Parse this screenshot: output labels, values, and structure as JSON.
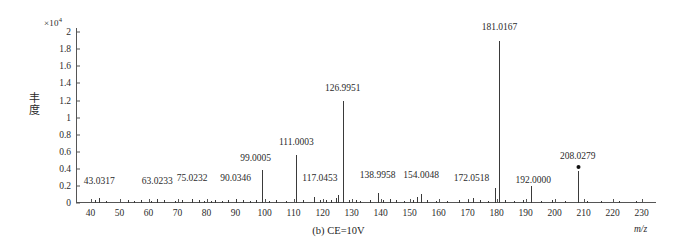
{
  "chart_data": {
    "type": "bar",
    "title": "",
    "caption": "(b) CE=10V",
    "xlabel": "m/z",
    "ylabel": "丰度",
    "y_exponent_prefix": "×10",
    "y_exponent_power": "4",
    "xlim": [
      35,
      235
    ],
    "ylim": [
      0,
      2.05
    ],
    "xticks": [
      40,
      50,
      60,
      70,
      80,
      90,
      100,
      110,
      120,
      130,
      140,
      150,
      160,
      170,
      180,
      190,
      200,
      210,
      220,
      230
    ],
    "yticks": [
      "0",
      "0.2",
      "0.4",
      "0.6",
      "0.8",
      "1",
      "1.2",
      "1.4",
      "1.6",
      "1.8",
      "2"
    ],
    "ytick_values": [
      0,
      0.2,
      0.4,
      0.6,
      0.8,
      1.0,
      1.2,
      1.4,
      1.6,
      1.8,
      2.0
    ],
    "grid": false,
    "legend": "none",
    "x": [
      43.0317,
      63.0233,
      75.0232,
      90.0346,
      99.0005,
      111.0003,
      117.0453,
      126.9951,
      138.9958,
      154.0048,
      172.0518,
      181.0167,
      192.0,
      208.0279
    ],
    "values": [
      0.06,
      0.05,
      0.05,
      0.05,
      0.39,
      0.56,
      0.07,
      1.19,
      0.12,
      0.11,
      0.06,
      1.9,
      0.2,
      0.38
    ],
    "labeled_peaks": [
      {
        "mz": "43.0317",
        "x": 43.0317,
        "y": 0.06,
        "label_y": 0.2,
        "label_dx": 0
      },
      {
        "mz": "63.0233",
        "x": 63.0233,
        "y": 0.05,
        "label_y": 0.2,
        "label_dx": 0
      },
      {
        "mz": "75.0232",
        "x": 75.0232,
        "y": 0.05,
        "label_y": 0.24,
        "label_dx": 0
      },
      {
        "mz": "90.0346",
        "x": 90.0346,
        "y": 0.05,
        "label_y": 0.24,
        "label_dx": 0
      },
      {
        "mz": "99.0005",
        "x": 99.0005,
        "y": 0.39,
        "label_y": 0.47,
        "label_dx": -6
      },
      {
        "mz": "111.0003",
        "x": 111.0003,
        "y": 0.56,
        "label_y": 0.66,
        "label_dx": 0
      },
      {
        "mz": "117.0453",
        "x": 117.0453,
        "y": 0.07,
        "label_y": 0.23,
        "label_dx": 6
      },
      {
        "mz": "126.9951",
        "x": 126.9951,
        "y": 1.19,
        "label_y": 1.29,
        "label_dx": 0
      },
      {
        "mz": "138.9958",
        "x": 138.9958,
        "y": 0.12,
        "label_y": 0.27,
        "label_dx": 0
      },
      {
        "mz": "154.0048",
        "x": 154.0048,
        "y": 0.11,
        "label_y": 0.27,
        "label_dx": 0
      },
      {
        "mz": "172.0518",
        "x": 172.0518,
        "y": 0.06,
        "label_y": 0.23,
        "label_dx": -2
      },
      {
        "mz": "181.0167",
        "x": 181.0167,
        "y": 1.9,
        "label_y": 2.0,
        "label_dx": 0
      },
      {
        "mz": "192.0000",
        "x": 192.0,
        "y": 0.2,
        "label_y": 0.21,
        "label_dx": 2
      },
      {
        "mz": "208.0279",
        "x": 208.0279,
        "y": 0.38,
        "label_y": 0.49,
        "label_dx": 0,
        "marker": true
      }
    ],
    "unlabeled_peaks": [
      {
        "x": 41.5,
        "y": 0.035
      },
      {
        "x": 45.2,
        "y": 0.025
      },
      {
        "x": 53.0,
        "y": 0.03
      },
      {
        "x": 55.1,
        "y": 0.025
      },
      {
        "x": 57.3,
        "y": 0.03
      },
      {
        "x": 61.0,
        "y": 0.025
      },
      {
        "x": 65.2,
        "y": 0.03
      },
      {
        "x": 69.1,
        "y": 0.025
      },
      {
        "x": 71.4,
        "y": 0.03
      },
      {
        "x": 77.3,
        "y": 0.035
      },
      {
        "x": 79.1,
        "y": 0.025
      },
      {
        "x": 81.5,
        "y": 0.025
      },
      {
        "x": 83.0,
        "y": 0.03
      },
      {
        "x": 85.2,
        "y": 0.025
      },
      {
        "x": 87.4,
        "y": 0.03
      },
      {
        "x": 92.6,
        "y": 0.03
      },
      {
        "x": 95.0,
        "y": 0.025
      },
      {
        "x": 97.2,
        "y": 0.03
      },
      {
        "x": 101.4,
        "y": 0.025
      },
      {
        "x": 104.0,
        "y": 0.03
      },
      {
        "x": 107.5,
        "y": 0.025
      },
      {
        "x": 113.2,
        "y": 0.03
      },
      {
        "x": 119.1,
        "y": 0.04
      },
      {
        "x": 121.3,
        "y": 0.035
      },
      {
        "x": 123.0,
        "y": 0.03
      },
      {
        "x": 124.5,
        "y": 0.06
      },
      {
        "x": 125.5,
        "y": 0.09
      },
      {
        "x": 129.2,
        "y": 0.04
      },
      {
        "x": 131.5,
        "y": 0.03
      },
      {
        "x": 133.1,
        "y": 0.025
      },
      {
        "x": 136.4,
        "y": 0.04
      },
      {
        "x": 141.0,
        "y": 0.035
      },
      {
        "x": 143.2,
        "y": 0.05
      },
      {
        "x": 145.5,
        "y": 0.03
      },
      {
        "x": 148.0,
        "y": 0.025
      },
      {
        "x": 151.2,
        "y": 0.04
      },
      {
        "x": 152.6,
        "y": 0.075
      },
      {
        "x": 156.0,
        "y": 0.035
      },
      {
        "x": 159.3,
        "y": 0.025
      },
      {
        "x": 163.1,
        "y": 0.025
      },
      {
        "x": 167.0,
        "y": 0.03
      },
      {
        "x": 170.2,
        "y": 0.04
      },
      {
        "x": 174.3,
        "y": 0.03
      },
      {
        "x": 177.0,
        "y": 0.025
      },
      {
        "x": 179.4,
        "y": 0.18
      },
      {
        "x": 183.0,
        "y": 0.04
      },
      {
        "x": 186.2,
        "y": 0.025
      },
      {
        "x": 189.0,
        "y": 0.03
      },
      {
        "x": 195.3,
        "y": 0.025
      },
      {
        "x": 199.0,
        "y": 0.03
      },
      {
        "x": 203.5,
        "y": 0.025
      },
      {
        "x": 211.2,
        "y": 0.02
      },
      {
        "x": 216.0,
        "y": 0.02
      },
      {
        "x": 222.4,
        "y": 0.02
      },
      {
        "x": 228.0,
        "y": 0.02
      }
    ]
  }
}
